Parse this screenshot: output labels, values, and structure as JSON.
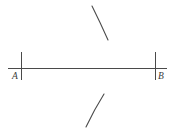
{
  "figure": {
    "kind": "geometric-construction",
    "width": 178,
    "height": 134,
    "background_color": "#ffffff",
    "ink_color": "#4a4a4a",
    "label_color": "#3a3a3a",
    "segment": {
      "name": "segment-ab",
      "x1": 8,
      "y1": 68,
      "x2": 167,
      "y2": 68,
      "stroke_width": 1
    },
    "ticks": [
      {
        "name": "tick-a",
        "x": 21,
        "y_top": 52,
        "y_bottom": 80,
        "stroke_width": 1
      },
      {
        "name": "tick-b",
        "x": 155,
        "y_top": 52,
        "y_bottom": 80,
        "stroke_width": 1
      }
    ],
    "points": [
      {
        "id": "A",
        "label": "A",
        "label_x": 12,
        "label_y": 79,
        "tick_x": 21
      },
      {
        "id": "B",
        "label": "B",
        "label_x": 158,
        "label_y": 79,
        "tick_x": 155
      }
    ],
    "arcs": [
      {
        "name": "arc-upper",
        "path": "M 92 6 Q 100 22 108 40",
        "stroke_width": 1.1
      },
      {
        "name": "arc-lower",
        "path": "M 104 94 Q 94 110 86 127",
        "stroke_width": 1.1
      }
    ]
  }
}
